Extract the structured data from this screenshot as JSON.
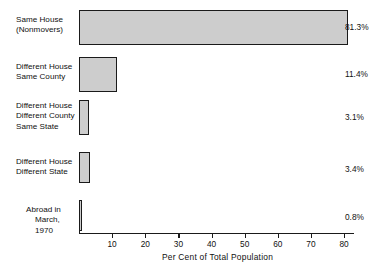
{
  "chart_data": {
    "type": "bar",
    "orientation": "horizontal",
    "title": "",
    "xlabel": "Per Cent of Total Population",
    "ylabel": "",
    "xlim": [
      0,
      83
    ],
    "grid": false,
    "legend": null,
    "categories": [
      "Same House\n(Nonmovers)",
      "Different House\nSame County",
      "Different House\nDifferent County\nSame State",
      "Different House\nDifferent State",
      "Abroad in\nMarch, 1970"
    ],
    "values": [
      81.3,
      11.4,
      3.1,
      3.4,
      0.8
    ],
    "value_labels": [
      "81.3%",
      "11.4%",
      "3.1%",
      "3.4%",
      "0.8%"
    ],
    "xticks": [
      10,
      20,
      30,
      40,
      50,
      60,
      70,
      80
    ],
    "xtick_labels": [
      "10",
      "20",
      "30",
      "40",
      "50",
      "60",
      "70",
      "80"
    ],
    "bar_fill_color": "#cdcdcd",
    "bar_edge_color": "#1a1a1a",
    "axis_color": "#1a1a1a",
    "background_color": "#ffffff"
  },
  "categories_lines": {
    "c0": {
      "l1": "Same House",
      "l2": "(Nonmovers)"
    },
    "c1": {
      "l1": "Different House",
      "l2": "Same County"
    },
    "c2": {
      "l1": "Different House",
      "l2": "Different County",
      "l3": "Same State"
    },
    "c3": {
      "l1": "Different House",
      "l2": "Different State"
    },
    "c4": {
      "l1": "Abroad in",
      "l2": "March, 1970"
    }
  }
}
